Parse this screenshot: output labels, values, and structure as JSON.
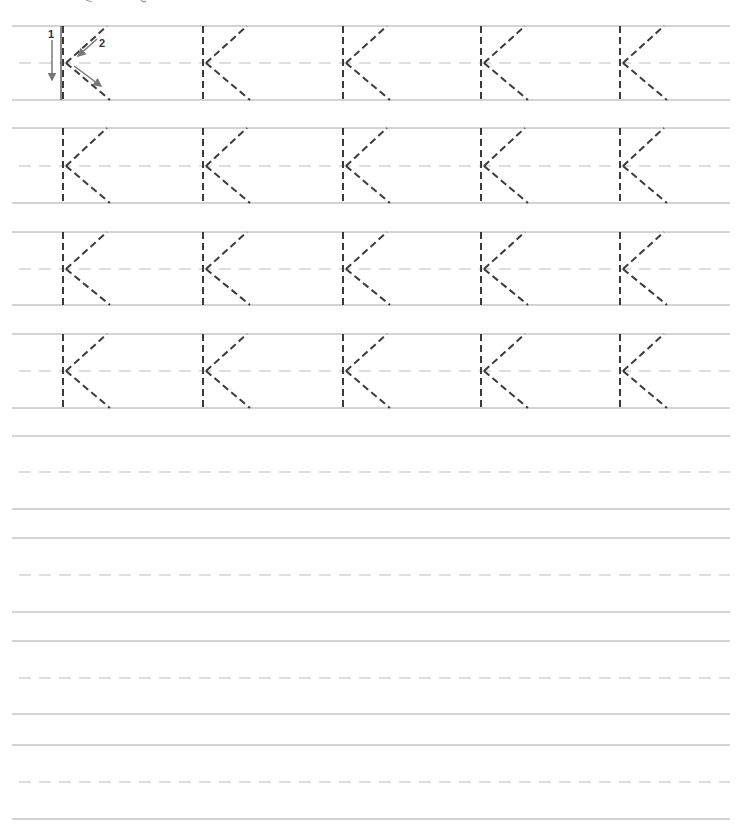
{
  "worksheet": {
    "letter": "K",
    "colors": {
      "background": "#ffffff",
      "rule_line": "#a8a8a8",
      "mid_line": "#bdbdbd",
      "letter_stroke": "#3a3a3a",
      "arrow": "#777777"
    },
    "stroke_order": [
      {
        "step": "1",
        "direction": "down"
      },
      {
        "step": "2",
        "direction": "down-left then down-right"
      }
    ],
    "trace_rows": 4,
    "letters_per_row": 5,
    "blank_practice_rows": 4
  },
  "layout": {
    "line_x_start": 12,
    "line_x_end": 730,
    "trace_rows": [
      {
        "top": 26,
        "mid": 63,
        "bottom": 100
      },
      {
        "top": 128,
        "mid": 166,
        "bottom": 203
      },
      {
        "top": 232,
        "mid": 269,
        "bottom": 305
      },
      {
        "top": 334,
        "mid": 371,
        "bottom": 408
      }
    ],
    "blank_rows": [
      {
        "top": 436,
        "mid": 472,
        "bottom": 509
      },
      {
        "top": 538,
        "mid": 575,
        "bottom": 612
      },
      {
        "top": 641,
        "mid": 678,
        "bottom": 714
      },
      {
        "top": 745,
        "mid": 782,
        "bottom": 819
      }
    ],
    "letter_x": [
      63,
      203,
      343,
      481,
      620
    ]
  },
  "labels": {
    "step1": "1",
    "step2": "2"
  }
}
